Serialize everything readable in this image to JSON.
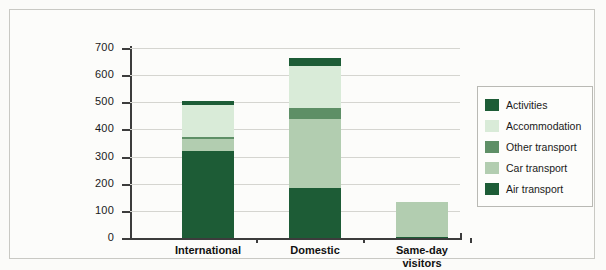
{
  "chart_data": {
    "type": "bar",
    "subtype": "stacked-vertical",
    "title": "",
    "xlabel": "",
    "ylabel": "CO2 emissions (Mton)",
    "ylabel_parts": {
      "pre": "CO",
      "sub": "2",
      "post": " emissions (Mton)"
    },
    "categories": [
      "International",
      "Domestic",
      "Same-day visitors"
    ],
    "category_labels": [
      {
        "line1": "International",
        "line2": ""
      },
      {
        "line1": "Domestic",
        "line2": ""
      },
      {
        "line1": "Same-day",
        "line2": "visitors"
      }
    ],
    "ylim": [
      0,
      700
    ],
    "yticks": [
      0,
      100,
      200,
      300,
      400,
      500,
      600,
      700
    ],
    "ytick_labels": [
      "0",
      "100",
      "200",
      "300",
      "400",
      "500",
      "600",
      "700"
    ],
    "grid": true,
    "legend_position": "right",
    "stack_order_bottom_to_top": [
      "Air transport",
      "Car transport",
      "Other transport",
      "Accommodation",
      "Activities"
    ],
    "series": [
      {
        "name": "Air transport",
        "color": "#1d5c36",
        "values": [
          320,
          183,
          5
        ]
      },
      {
        "name": "Car transport",
        "color": "#b2cdb0",
        "values": [
          45,
          257,
          128
        ]
      },
      {
        "name": "Other transport",
        "color": "#5e8f66",
        "values": [
          8,
          40,
          0
        ]
      },
      {
        "name": "Accommodation",
        "color": "#d9ebd8",
        "values": [
          117,
          155,
          0
        ]
      },
      {
        "name": "Activities",
        "color": "#1d5c36",
        "values": [
          15,
          27,
          0
        ]
      }
    ],
    "totals": [
      505,
      662,
      133
    ],
    "legend": [
      {
        "label": "Activities",
        "color": "#1d5c36"
      },
      {
        "label": "Accommodation",
        "color": "#d9ebd8"
      },
      {
        "label": "Other transport",
        "color": "#5e8f66"
      },
      {
        "label": "Car transport",
        "color": "#b2cdb0"
      },
      {
        "label": "Air transport",
        "color": "#1d5c36"
      }
    ]
  }
}
